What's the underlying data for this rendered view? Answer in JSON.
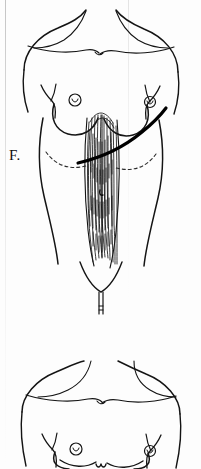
{
  "figure": {
    "panel_label": "F.",
    "view": "anterior",
    "medium": "pen-and-ink line drawing, scanned page",
    "background_color": "#fdfdfd",
    "ink_color": "#111111",
    "dashed_color": "#333333",
    "marking_color": "#000000"
  },
  "panels": [
    {
      "id": "panel-f",
      "label": "F.",
      "label_position": {
        "x": 9,
        "y": 148
      },
      "description": "Female anterior torso with rectus abdominis musculature exposed and an oblique surgical incision marking running from the left lower abdomen upward to the right axillary region.",
      "features": [
        {
          "name": "shoulder-outline",
          "kind": "contour"
        },
        {
          "name": "clavicle-line-left",
          "kind": "contour"
        },
        {
          "name": "clavicle-line-right",
          "kind": "contour"
        },
        {
          "name": "breast-left",
          "kind": "contour"
        },
        {
          "name": "breast-right",
          "kind": "contour"
        },
        {
          "name": "areola-left",
          "kind": "detail"
        },
        {
          "name": "areola-right",
          "kind": "detail"
        },
        {
          "name": "axillary-fold-left",
          "kind": "contour"
        },
        {
          "name": "axillary-fold-right",
          "kind": "contour"
        },
        {
          "name": "costal-margin-left",
          "kind": "dashed-guide"
        },
        {
          "name": "costal-margin-right",
          "kind": "dashed-guide"
        },
        {
          "name": "rectus-abdominis-striations",
          "kind": "muscle-hatching"
        },
        {
          "name": "linea-alba",
          "kind": "detail"
        },
        {
          "name": "umbilicus",
          "kind": "detail"
        },
        {
          "name": "incision-marking",
          "kind": "bold-curve"
        },
        {
          "name": "inguinal-crease",
          "kind": "contour"
        },
        {
          "name": "pubic-midline",
          "kind": "contour"
        },
        {
          "name": "torso-outline-left",
          "kind": "contour"
        },
        {
          "name": "torso-outline-right",
          "kind": "contour"
        }
      ]
    },
    {
      "id": "panel-next",
      "label": "",
      "description": "Beginning of the next figure: the same female anterior torso, cropped at the lower edge of the page, showing shoulders, clavicles, breasts and areolae.",
      "features": [
        {
          "name": "shoulder-outline",
          "kind": "contour"
        },
        {
          "name": "clavicle-line-left",
          "kind": "contour"
        },
        {
          "name": "clavicle-line-right",
          "kind": "contour"
        },
        {
          "name": "breast-left",
          "kind": "contour"
        },
        {
          "name": "breast-right",
          "kind": "contour"
        },
        {
          "name": "areola-left",
          "kind": "detail"
        },
        {
          "name": "areola-right",
          "kind": "detail"
        },
        {
          "name": "axillary-fold-left",
          "kind": "contour"
        },
        {
          "name": "axillary-fold-right",
          "kind": "contour"
        },
        {
          "name": "sternal-notch-detail",
          "kind": "detail"
        }
      ]
    }
  ]
}
